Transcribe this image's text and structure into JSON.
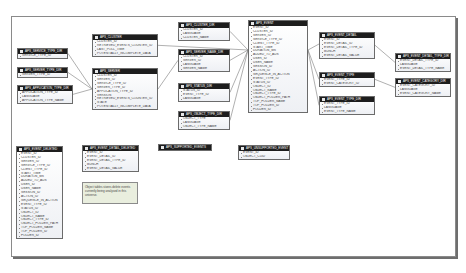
{
  "diagram": {
    "tables": [
      {
        "id": "t_service_type",
        "title": "APS_SERVICE_TYPE_DIR",
        "x": 17,
        "y": 48,
        "w": 51,
        "fields": [
          "SERVICE_TYPE_ID"
        ]
      },
      {
        "id": "t_server_type",
        "title": "APS_SERVER_TYPE_DIR",
        "x": 17,
        "y": 67,
        "w": 51,
        "fields": [
          "SERVER_TYPE_ID"
        ]
      },
      {
        "id": "t_application_type",
        "title": "APS_APPLICATION_TYPE_DIR",
        "x": 17,
        "y": 85,
        "w": 56,
        "fields": [
          "APPLICATION_TYPE_ID",
          "LANGUAGE",
          "APPLICATION_TYPE_NAME"
        ]
      },
      {
        "id": "t_cluster",
        "title": "APS_CLUSTER",
        "x": 92,
        "y": 34,
        "w": 66,
        "fields": [
          "CLUSTER_ID",
          "RETRIEVED_EVENTS_COUNTER_ID",
          "LAST_POLL_TIME",
          "POTENTIALLY_INCOMPLETE_DATA"
        ]
      },
      {
        "id": "t_server",
        "title": "APS_SERVER",
        "x": 92,
        "y": 68,
        "w": 66,
        "fields": [
          "CLUSTER_ID",
          "SERVER_ID",
          "SERVICE_TYPE_ID",
          "SERVER_TYPE_ID",
          "APPLICATION_TYPE_ID",
          "VERSION",
          "RETRIEVED_EVENTS_COUNTER_ID",
          "STATE",
          "POTENTIALLY_INCOMPLETE_DATA"
        ]
      },
      {
        "id": "t_cluster_dir",
        "title": "APS_CLUSTER_DIR",
        "x": 178,
        "y": 22,
        "w": 52,
        "fields": [
          "CLUSTER_ID",
          "LANGUAGE",
          "CLUSTER_NAME"
        ]
      },
      {
        "id": "t_server_name",
        "title": "APS_SERVER_NAME_DIR",
        "x": 178,
        "y": 49,
        "w": 52,
        "fields": [
          "CLUSTER_ID",
          "SERVER_ID",
          "LANGUAGE",
          "SERVER_NAME"
        ]
      },
      {
        "id": "t_status",
        "title": "APS_STATUS_DIR",
        "x": 178,
        "y": 83,
        "w": 52,
        "fields": [
          "STATUS_ID",
          "EVENT_TYPE_ID",
          "LANGUAGE"
        ]
      },
      {
        "id": "t_object_type",
        "title": "APS_OBJECT_TYPE_DIR",
        "x": 178,
        "y": 111,
        "w": 52,
        "fields": [
          "OBJECT_TYPE",
          "LANGUAGE",
          "OBJECT_TYPE_NAME"
        ]
      },
      {
        "id": "t_supported_events",
        "title": "APS_SUPPORTED_EVENTS",
        "x": 158,
        "y": 144,
        "w": 54,
        "fields": []
      },
      {
        "id": "t_event",
        "title": "APS_EVENT",
        "x": 248,
        "y": 20,
        "w": 60,
        "fields": [
          "EVENT_ID",
          "CLUSTER_ID",
          "SERVER_ID",
          "SERVICE_TYPE_ID",
          "CLIENT_TYPE_ID",
          "START_TIME",
          "DURATION_MS",
          "ADDED_TO_ADS",
          "USER_ID",
          "USER_NAME",
          "SESSION_ID",
          "ACTION_ID",
          "SEQUENCE_IN_ACTION",
          "EVENT_TYPE_ID",
          "STATUS_ID",
          "OBJECT_ID",
          "OBJECT_NAME",
          "OBJECT_TYPE_ID",
          "OBJECT_FOLDER_PATH",
          "TOP_FOLDER_NAME",
          "TOP_FOLDER_ID",
          "FOLDER_ID"
        ]
      },
      {
        "id": "t_unsupported",
        "title": "APS_UNSUPPORTED_EVENT",
        "x": 238,
        "y": 145,
        "w": 52,
        "fields": [
          "EVENT_ID",
          "OBJECT_CUID"
        ]
      },
      {
        "id": "t_event_detail",
        "title": "APS_EVENT_DETAIL",
        "x": 319,
        "y": 32,
        "w": 56,
        "fields": [
          "EVENT_ID",
          "EVENT_DETAIL_ID",
          "EVENT_DETAIL_TYPE_ID",
          "BUNCH",
          "EVENT_DETAIL_VALUE"
        ]
      },
      {
        "id": "t_event_type",
        "title": "APS_EVENT_TYPE",
        "x": 319,
        "y": 72,
        "w": 56,
        "fields": [
          "EVENT_TYPE_ID",
          "EVENT_CATEGORY_ID"
        ]
      },
      {
        "id": "t_event_type_dir",
        "title": "APS_EVENT_TYPE_DIR",
        "x": 319,
        "y": 96,
        "w": 56,
        "fields": [
          "EVENT_TYPE_ID",
          "LANGUAGE",
          "EVENT_TYPE_NAME"
        ]
      },
      {
        "id": "t_event_detail_type_dir",
        "title": "APS_EVENT_DETAIL_TYPE_DIR",
        "x": 395,
        "y": 53,
        "w": 56,
        "fields": [
          "EVENT_DETAIL_TYPE_ID",
          "LANGUAGE",
          "EVENT_DETAIL_TYPE_NAME"
        ]
      },
      {
        "id": "t_event_category_dir",
        "title": "APS_EVENT_CATEGORY_DIR",
        "x": 395,
        "y": 78,
        "w": 56,
        "fields": [
          "EVENT_CATEGORY_ID",
          "LANGUAGE",
          "EVENT_CATEGORY_NAME"
        ]
      },
      {
        "id": "t_event_deleted",
        "title": "APS_EVENT_DELETED",
        "x": 16,
        "y": 146,
        "w": 47,
        "fields": [
          "EVENT_ID",
          "CLUSTER_ID",
          "SERVER_ID",
          "SERVICE_TYPE_ID",
          "CLIENT_TYPE_ID",
          "START_TIME",
          "DURATION_MS",
          "ADDED_TO_ADS",
          "USER_ID",
          "USER_NAME",
          "SESSION_ID",
          "ACTION_ID",
          "SEQUENCE_IN_ACTION",
          "EVENT_TYPE_ID",
          "STATUS_ID",
          "OBJECT_ID",
          "OBJECT_NAME",
          "OBJECT_TYPE_ID",
          "OBJECT_FOLDER_PATH",
          "TOP_FOLDER_NAME",
          "TOP_FOLDER_ID",
          "FOLDER_ID"
        ]
      },
      {
        "id": "t_event_detail_deleted",
        "title": "APS_EVENT_DETAIL_DELETED",
        "x": 82,
        "y": 145,
        "w": 57,
        "fields": [
          "EVENT_ID",
          "EVENT_DETAIL_ID",
          "EVENT_DETAIL_TYPE_ID",
          "BUNCH",
          "EVENT_DETAIL_VALUE"
        ]
      }
    ],
    "note": {
      "text": "Object tables stores delete events currently being analysed in this universe.",
      "x": 82,
      "y": 182,
      "w": 56,
      "h": 22
    },
    "links": [
      [
        "t_service_type",
        "t_server"
      ],
      [
        "t_server_type",
        "t_server"
      ],
      [
        "t_application_type",
        "t_server"
      ],
      [
        "t_cluster_dir",
        "t_event"
      ],
      [
        "t_server_name",
        "t_server"
      ],
      [
        "t_server_name",
        "t_event"
      ],
      [
        "t_status",
        "t_event"
      ],
      [
        "t_object_type",
        "t_event"
      ],
      [
        "t_cluster",
        "t_event"
      ],
      [
        "t_event_detail",
        "t_event"
      ],
      [
        "t_event_type",
        "t_event"
      ],
      [
        "t_event_type_dir",
        "t_event"
      ],
      [
        "t_event_detail_type_dir",
        "t_event_detail"
      ],
      [
        "t_event_category_dir",
        "t_event_type"
      ]
    ]
  }
}
